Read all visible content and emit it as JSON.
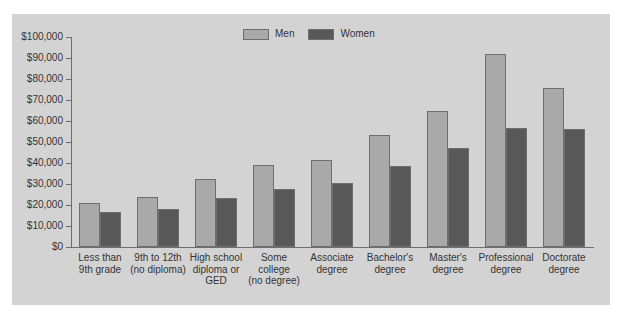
{
  "chart_data": {
    "type": "bar",
    "title": "",
    "subtitle": "",
    "xlabel": "",
    "ylabel": "",
    "ylim": [
      0,
      100000
    ],
    "grid": false,
    "legend_position": "top-center",
    "categories": [
      "Less than\n9th grade",
      "9th to 12th\n(no diploma)",
      "High school\ndiploma or\nGED",
      "Some\ncollege\n(no degree)",
      "Associate\ndegree",
      "Bachelor's\ndegree",
      "Master's\ndegree",
      "Professional\ndegree",
      "Doctorate\ndegree"
    ],
    "category_lines": [
      [
        "Less than",
        "9th grade"
      ],
      [
        "9th to 12th",
        "(no diploma)"
      ],
      [
        "High school",
        "diploma or",
        "GED"
      ],
      [
        "Some",
        "college",
        "(no degree)"
      ],
      [
        "Associate",
        "degree"
      ],
      [
        "Bachelor's",
        "degree"
      ],
      [
        "Master's",
        "degree"
      ],
      [
        "Professional",
        "degree"
      ],
      [
        "Doctorate",
        "degree"
      ]
    ],
    "ytick_labels": [
      "$100,000",
      "$90,000",
      "$80,000",
      "$70,000",
      "$60,000",
      "$50,000",
      "$40,000",
      "$30,000",
      "$20,000",
      "$10,000",
      "$0"
    ],
    "ytick_values": [
      100000,
      90000,
      80000,
      70000,
      60000,
      50000,
      40000,
      30000,
      20000,
      10000,
      0
    ],
    "series": [
      {
        "name": "Men",
        "color": "#a9a9a9",
        "values": [
          21000,
          24000,
          32500,
          39000,
          41500,
          53500,
          65000,
          92000,
          75500
        ]
      },
      {
        "name": "Women",
        "color": "#585858",
        "values": [
          16500,
          18000,
          23500,
          27500,
          30500,
          38500,
          47000,
          56500,
          56000
        ]
      }
    ]
  },
  "legend": {
    "items": [
      {
        "label": "Men",
        "color": "#a9a9a9"
      },
      {
        "label": "Women",
        "color": "#585858"
      }
    ]
  },
  "colors": {
    "panel_background": "#d3d3d3",
    "figure_background": "#ffffff",
    "axis": "#6e6e6e",
    "text": "#333333",
    "men_bar": "#a9a9a9",
    "women_bar": "#585858"
  }
}
